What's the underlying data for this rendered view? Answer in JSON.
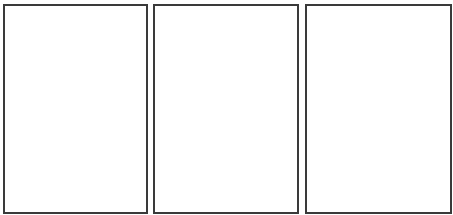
{
  "panels": [
    {
      "label": "",
      "border_color": "#3a3a3a",
      "background": "#ffffff"
    },
    {
      "label": "",
      "border_color": "#3a3a3a",
      "background": "#ffffff"
    },
    {
      "label": "",
      "border_color": "#3a3a3a",
      "background": "#ffffff"
    }
  ]
}
